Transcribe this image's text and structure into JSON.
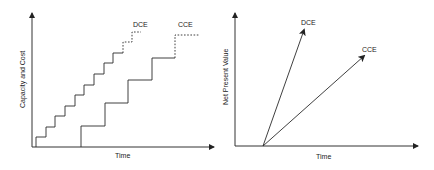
{
  "left_panel": {
    "ylabel": "Capacity and Cost",
    "xlabel": "Time",
    "series": [
      {
        "name": "DCE",
        "label": "DCE",
        "style": "fine staircase, dashed final steps"
      },
      {
        "name": "CCE",
        "label": "CCE",
        "style": "coarse staircase, dashed final step"
      }
    ]
  },
  "right_panel": {
    "ylabel": "Net Present Value",
    "xlabel": "Time",
    "series": [
      {
        "name": "DCE",
        "label": "DCE",
        "style": "steep arrow"
      },
      {
        "name": "CCE",
        "label": "CCE",
        "style": "shallower arrow"
      }
    ]
  },
  "colors": {
    "line": "#2a2a2a",
    "background": "#ffffff"
  }
}
